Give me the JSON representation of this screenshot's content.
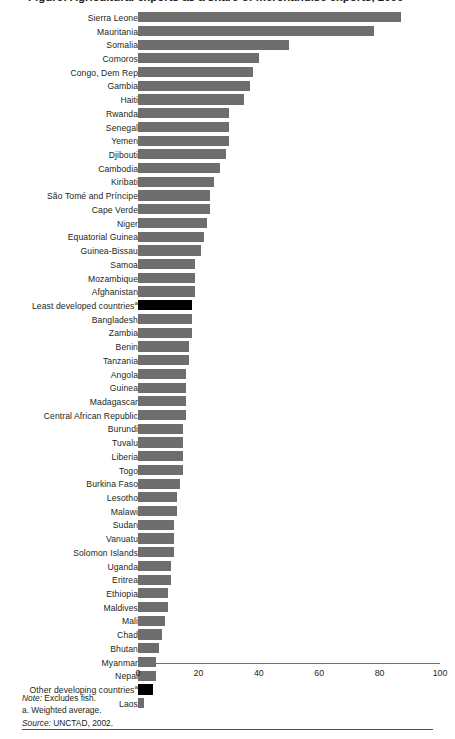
{
  "figure": {
    "title_partial": "Figure: Agricultural exports as a share of merchandise exports, 2000",
    "notes": {
      "note_label": "Note:",
      "note_text": " Excludes fish.",
      "footnote_a": "a. Weighted average.",
      "source_label": "Source:",
      "source_text": " UNCTAD, 2002."
    }
  },
  "chart_data": {
    "type": "bar",
    "orientation": "horizontal",
    "title": "Figure: Agricultural exports as a share of merchandise exports, 2000",
    "xlabel": "",
    "ylabel": "",
    "xlim": [
      0,
      100
    ],
    "xticks": [
      0,
      20,
      40,
      60,
      80,
      100
    ],
    "grid": false,
    "legend": null,
    "colors": {
      "bar": "#6e6e6e",
      "highlight_bar": "#000000",
      "axis": "#6f6f6f",
      "text": "#231f20"
    },
    "categories": [
      "Sierra Leone",
      "Mauritania",
      "Somalia",
      "Comoros",
      "Congo, Dem Rep",
      "Gambia",
      "Haiti",
      "Rwanda",
      "Senegal",
      "Yemen",
      "Djibouti",
      "Cambodia",
      "Kiribati",
      "São Tomé and Príncipe",
      "Cape Verde",
      "Niger",
      "Equatorial Guinea",
      "Guinea-Bissau",
      "Samoa",
      "Mozambique",
      "Afghanistan",
      "Least developed countries",
      "Bangladesh",
      "Zambia",
      "Benin",
      "Tanzania",
      "Angola",
      "Guinea",
      "Madagascar",
      "Central African Republic",
      "Burundi",
      "Tuvalu",
      "Liberia",
      "Togo",
      "Burkina Faso",
      "Lesotho",
      "Malawi",
      "Sudan",
      "Vanuatu",
      "Solomon Islands",
      "Uganda",
      "Eritrea",
      "Ethiopia",
      "Maldives",
      "Mali",
      "Chad",
      "Bhutan",
      "Myanmar",
      "Nepal",
      "Other developing countries",
      "Laos"
    ],
    "values": [
      87,
      78,
      50,
      40,
      38,
      37,
      35,
      30,
      30,
      30,
      29,
      27,
      25,
      24,
      24,
      23,
      22,
      21,
      19,
      19,
      19,
      18,
      18,
      18,
      17,
      17,
      16,
      16,
      16,
      16,
      15,
      15,
      15,
      15,
      14,
      13,
      13,
      12,
      12,
      12,
      11,
      11,
      10,
      10,
      9,
      8,
      7,
      6,
      6,
      5,
      2
    ],
    "footnote_markers": {
      "Least developed countries": "a",
      "Other developing countries": "a"
    },
    "highlighted": [
      "Least developed countries",
      "Other developing countries"
    ],
    "notes": [
      "Note: Excludes fish.",
      "a. Weighted average.",
      "Source: UNCTAD, 2002."
    ]
  }
}
